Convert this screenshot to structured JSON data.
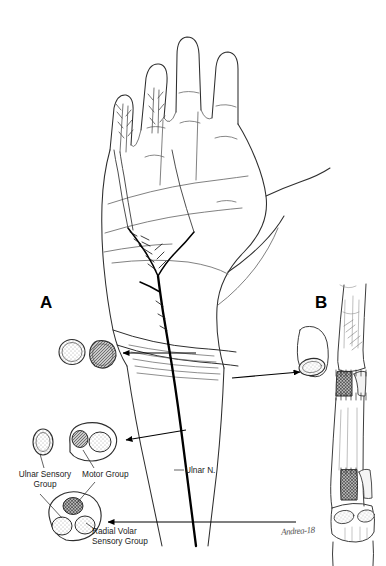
{
  "figure": {
    "background_color": "#ffffff",
    "ink_color": "#000000",
    "line_color": "#3c3c3c",
    "nerve_color": "#000000",
    "width": 386,
    "height": 566
  },
  "panels": [
    {
      "id": "A",
      "letter": "A",
      "description": "Volar view of hand and distal forearm showing the ulnar nerve and its fascicular cross sections"
    },
    {
      "id": "B",
      "letter": "B",
      "description": "Forearm nerve segment with interfascicular nerve graft and cross section"
    }
  ],
  "labels": {
    "ulnar_sensory_group": "Ulnar Sensory\nGroup",
    "motor_group": "Motor Group",
    "radial_volar_sensory_group": "Radial Volar\nSensory Group",
    "ulnar_nerve": "Ulnar N."
  },
  "signature": {
    "text": "Andrea-18"
  },
  "cross_sections": [
    {
      "name": "proximal-pair-outline",
      "location": "panel-A upper left",
      "fill": "none",
      "pattern": "stipple",
      "fascicles": 1
    },
    {
      "name": "proximal-pair-shaded",
      "location": "panel-A upper left",
      "fill": "#b8b8b8",
      "pattern": "hatch",
      "fascicles": 1
    },
    {
      "name": "ulnar-sensory-group-section",
      "location": "panel-A mid left",
      "fill": "none",
      "pattern": "stipple",
      "fascicles": 1
    },
    {
      "name": "motor-group-section",
      "location": "panel-A mid",
      "fill": "#9e9e9e",
      "pattern": "hatch+stipple",
      "fascicles": 2
    },
    {
      "name": "trifascicular-section",
      "location": "panel-A lower left",
      "fill": "#8f8f8f",
      "pattern": "crosshatch+stipple",
      "fascicles": 3
    },
    {
      "name": "graft-section",
      "location": "panel-B upper left",
      "fill": "none",
      "pattern": "stipple",
      "fascicles": 1
    }
  ],
  "arrows": [
    {
      "name": "arrow-to-proximal-section",
      "from": "wrist-level-nerve",
      "to": "proximal-pair-shaded"
    },
    {
      "name": "arrow-to-motor-section",
      "from": "mid-forearm-nerve",
      "to": "motor-group-section"
    },
    {
      "name": "arrow-to-trifascicular-section",
      "from": "distal-forearm-nerve",
      "to": "trifascicular-section"
    },
    {
      "name": "arrow-to-graft-section",
      "from": "panel-B-graft",
      "to": "graft-section"
    }
  ]
}
